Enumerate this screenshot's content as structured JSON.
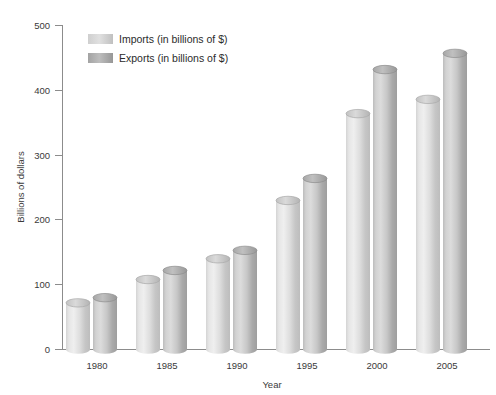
{
  "chart_data": {
    "type": "bar",
    "title": "",
    "subtitle": "",
    "xlabel": "Year",
    "ylabel": "Billions of dollars",
    "categories": [
      "1980",
      "1985",
      "1990",
      "1995",
      "2000",
      "2005"
    ],
    "series": [
      {
        "name": "Imports (in billions of $)",
        "values": [
          72,
          108,
          140,
          230,
          364,
          386
        ],
        "color": "#c9c9c9"
      },
      {
        "name": "Exports (in billions of $)",
        "values": [
          80,
          122,
          153,
          264,
          432,
          457
        ],
        "color": "#a8a8a8"
      }
    ],
    "ylim": [
      0,
      500
    ],
    "yticks": [
      0,
      100,
      200,
      300,
      400,
      500
    ],
    "ytick_labels": [
      "0",
      "100",
      "200",
      "300",
      "400",
      "500"
    ],
    "grid": false,
    "legend_position": "top-left",
    "bar_style": "cylinder"
  },
  "legend": {
    "items": [
      {
        "label": "Imports (in billions of $)",
        "swatch_name": "legend-swatch-imports"
      },
      {
        "label": "Exports (in billions of $)",
        "swatch_name": "legend-swatch-exports"
      }
    ]
  },
  "axes": {
    "y_title": "Billions of dollars",
    "x_title": "Year",
    "y_labels": [
      "500",
      "400",
      "300",
      "200",
      "100",
      "0"
    ],
    "x_labels": [
      "1980",
      "1985",
      "1990",
      "1995",
      "2000",
      "2005"
    ]
  },
  "colors": {
    "imports_light": "#e3e3e3",
    "imports_mid": "#c9c9c9",
    "imports_dark": "#b4b4b4",
    "exports_light": "#cccccc",
    "exports_mid": "#a8a8a8",
    "exports_dark": "#949494",
    "axis": "#8c8c8c",
    "text": "#3a3a3a",
    "background": "#ffffff"
  }
}
